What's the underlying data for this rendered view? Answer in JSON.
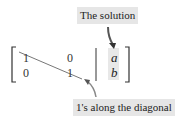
{
  "diagram": {
    "top_label": "The solution",
    "bottom_label": "1's along the diagonal",
    "matrix": {
      "rows": [
        {
          "c1": "1",
          "c2": "0",
          "rhs": "a"
        },
        {
          "c1": "0",
          "c2": "1",
          "rhs": "b"
        }
      ]
    },
    "colors": {
      "label_bg": "#e6e6e6",
      "ink": "#222222",
      "arrow": "#6b6b6b"
    }
  }
}
